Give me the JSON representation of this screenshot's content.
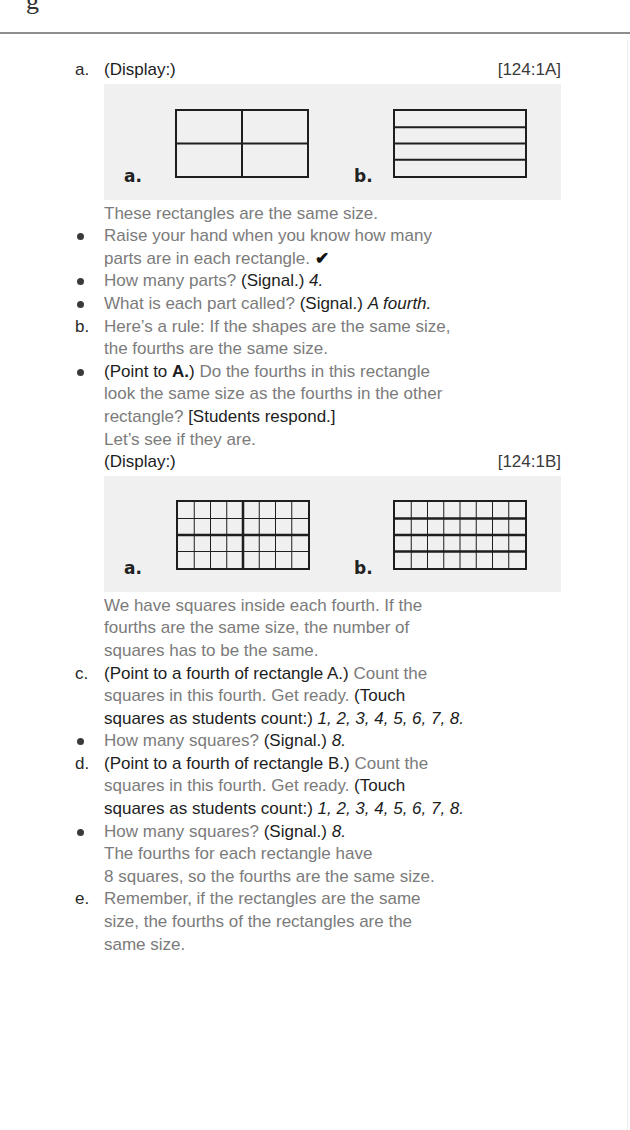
{
  "page": {
    "top_glyph": "g"
  },
  "section_a": {
    "marker": "a.",
    "display_label": "(Display:)",
    "ref": "[124:1A]",
    "figure": {
      "label_a": "a.",
      "label_b": "b.",
      "rect_a": {
        "cols": 2,
        "rows": 2
      },
      "rect_b": {
        "cols": 1,
        "rows": 4
      }
    },
    "intro": "These rectangles are the same size.",
    "bullets": [
      {
        "line1": "Raise your hand when you know how many",
        "line2": "parts are in each rectangle.",
        "check": "✔"
      },
      {
        "text": "How many parts?",
        "signal": "(Signal.)",
        "answer": "4."
      },
      {
        "text": "What is each part called?",
        "signal": "(Signal.)",
        "answer": "A fourth."
      }
    ]
  },
  "section_b": {
    "marker": "b.",
    "line1": "Here’s a rule: If the shapes are the same size,",
    "line2": "the fourths are the same size.",
    "bullet": {
      "direction_open": "(Point to ",
      "direction_bold": "A.",
      "direction_close": ")",
      "line1_rest": " Do the fourths in this rectangle",
      "line2": "look the same size as the fourths in the other",
      "line3_text": "rectangle?",
      "line3_response": "[Students respond.]",
      "line4": "Let’s see if they are."
    },
    "display_label": "(Display:)",
    "ref": "[124:1B]",
    "figure": {
      "label_a": "a.",
      "label_b": "b.",
      "rect_a": {
        "cols": 8,
        "rows": 4,
        "thick_cols": [
          4
        ],
        "thick_rows": [
          2
        ]
      },
      "rect_b": {
        "cols": 8,
        "rows": 4,
        "thick_cols": [],
        "thick_rows": [
          1,
          2,
          3
        ]
      }
    },
    "after_figure": [
      "We have squares inside each fourth. If the",
      "fourths are the same size, the number of",
      "squares has to be the same."
    ]
  },
  "section_c": {
    "marker": "c.",
    "direction": "(Point to a fourth of rectangle A.)",
    "line1_rest": " Count the",
    "line2_text": "squares in this fourth. Get ready.",
    "line2_direction": " (Touch",
    "line3_direction": "squares as students count:)",
    "line3_answer": " 1, 2, 3, 4, 5, 6, 7, 8.",
    "bullet": {
      "text": "How many squares?",
      "signal": "(Signal.)",
      "answer": "8."
    }
  },
  "section_d": {
    "marker": "d.",
    "direction": "(Point to a fourth of rectangle B.)",
    "line1_rest": " Count the",
    "line2_text": "squares in this fourth. Get ready.",
    "line2_direction": " (Touch",
    "line3_direction": "squares as students count:)",
    "line3_answer": " 1, 2, 3, 4, 5, 6, 7, 8.",
    "bullet": {
      "text": "How many squares?",
      "signal": "(Signal.)",
      "answer": "8."
    },
    "conclusion": [
      "The fourths for each rectangle have",
      "8 squares, so the fourths are the same size."
    ]
  },
  "section_e": {
    "marker": "e.",
    "lines": [
      "Remember, if the rectangles are the same",
      "size, the fourths of the rectangles are the",
      "same size."
    ]
  }
}
